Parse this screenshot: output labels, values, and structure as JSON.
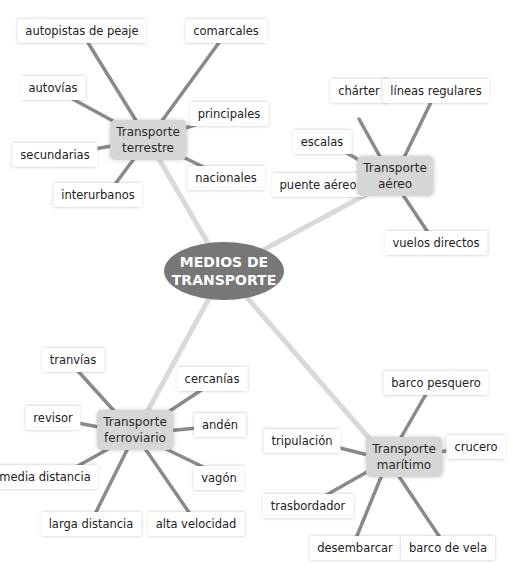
{
  "center": {
    "line1": "MEDIOS DE",
    "line2": "TRANSPORTE"
  },
  "colors": {
    "center_fill": "#777777",
    "hub_fill": "#d6d6d6",
    "main_line": "#d9d9d9",
    "spoke_line": "#888888"
  },
  "hubs": [
    {
      "id": "terrestre",
      "line1": "Transporte",
      "line2": "terrestre",
      "leaves": [
        "autopistas de peaje",
        "comarcales",
        "autovías",
        "principales",
        "secundarias",
        "nacionales",
        "interurbanos"
      ]
    },
    {
      "id": "aereo",
      "line1": "Transporte",
      "line2": "aéreo",
      "leaves": [
        "chárter",
        "líneas regulares",
        "escalas",
        "puente aéreo",
        "vuelos directos"
      ]
    },
    {
      "id": "ferroviario",
      "line1": "Transporte",
      "line2": "ferroviario",
      "leaves": [
        "tranvías",
        "cercanías",
        "revisor",
        "andén",
        "media distancia",
        "vagón",
        "larga distancia",
        "alta velocidad"
      ]
    },
    {
      "id": "maritimo",
      "line1": "Transporte",
      "line2": "marítimo",
      "leaves": [
        "barco pesquero",
        "tripulación",
        "crucero",
        "trasbordador",
        "desembarcar",
        "barco de vela"
      ]
    }
  ]
}
